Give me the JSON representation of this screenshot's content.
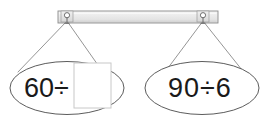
{
  "figure": {
    "type": "hanging-signs-math-figure",
    "width": 270,
    "height": 123,
    "background_color": "#ffffff"
  },
  "rail": {
    "label": "hanging rail",
    "x": 58,
    "y": 11,
    "width": 160,
    "height": 12,
    "fill_color": "#e9e9e9",
    "border_color": "#8c8c8c",
    "inner_highlight_color": "#f7f7f7"
  },
  "hooks": [
    {
      "name": "left-hook",
      "cx": 67,
      "cy": 16,
      "ring_radius": 2.6,
      "plate_x": 61,
      "plate_y": 11,
      "plate_width": 12,
      "plate_height": 11,
      "color": "#6e6e6e"
    },
    {
      "name": "right-hook",
      "cx": 203,
      "cy": 16,
      "ring_radius": 2.6,
      "plate_x": 197,
      "plate_y": 11,
      "plate_width": 12,
      "plate_height": 11,
      "color": "#6e6e6e"
    }
  ],
  "strings": {
    "color": "#7a7a7a",
    "width": 0.8,
    "segments": [
      {
        "name": "left-sign-left-string",
        "x1": 67,
        "y1": 21,
        "x2": 18,
        "y2": 72
      },
      {
        "name": "left-sign-right-string",
        "x1": 67,
        "y1": 21,
        "x2": 100,
        "y2": 68
      },
      {
        "name": "right-sign-left-string",
        "x1": 203,
        "y1": 21,
        "x2": 168,
        "y2": 68
      },
      {
        "name": "right-sign-right-string",
        "x1": 203,
        "y1": 21,
        "x2": 242,
        "y2": 70
      }
    ]
  },
  "signs": [
    {
      "name": "left-sign",
      "cx": 67,
      "cy": 88,
      "rx": 57,
      "ry": 26.5,
      "stroke_color": "#4a4a4a",
      "fill_color": "#ffffff",
      "expression": "60÷",
      "has_answer_box": true,
      "answer_box": {
        "label": "empty answer box",
        "x": 74,
        "y": 63,
        "width": 37,
        "height": 45,
        "fill_color": "#ffffff",
        "border_color": "#c8c8c8",
        "value": ""
      }
    },
    {
      "name": "right-sign",
      "cx": 202,
      "cy": 88,
      "rx": 57,
      "ry": 26.5,
      "stroke_color": "#4a4a4a",
      "fill_color": "#ffffff",
      "expression": "90÷6",
      "has_answer_box": false
    }
  ]
}
